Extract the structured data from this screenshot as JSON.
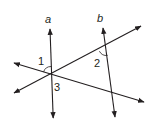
{
  "diagram": {
    "line_labels": {
      "a": "a",
      "b": "b"
    },
    "angle_labels": {
      "angle1": "1",
      "angle2": "2",
      "angle3": "3"
    },
    "colors": {
      "stroke": "#231f20",
      "background": "#ffffff"
    }
  }
}
